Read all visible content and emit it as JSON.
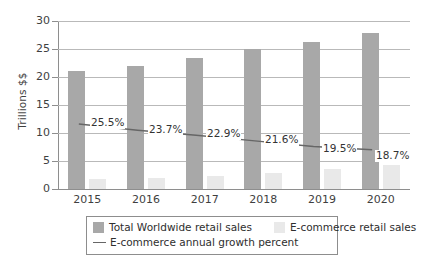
{
  "chart_data": {
    "type": "bar",
    "title": "",
    "subtitle": "",
    "xlabel": "",
    "ylabel": "Trillions $$",
    "categories": [
      "2015",
      "2016",
      "2017",
      "2018",
      "2019",
      "2020"
    ],
    "ylim": [
      0,
      30
    ],
    "y_ticks": [
      "0",
      "5",
      "10",
      "15",
      "20",
      "25",
      "30"
    ],
    "y_tick_values": [
      0,
      5,
      10,
      15,
      20,
      25,
      30
    ],
    "grid": true,
    "legend_position": "bottom",
    "series": [
      {
        "name": "Total Worldwide retail sales",
        "type": "bar",
        "color": "#a8a8a8",
        "values": [
          21.0,
          22.0,
          23.4,
          25.0,
          26.3,
          27.8
        ]
      },
      {
        "name": "E-commerce retail sales",
        "type": "bar",
        "color": "#e9e9e9",
        "values": [
          1.7,
          2.0,
          2.4,
          2.9,
          3.5,
          4.2
        ]
      },
      {
        "name": "E-commerce annual growth percent",
        "type": "line",
        "color": "#666666",
        "values": [
          25.5,
          23.7,
          22.9,
          21.6,
          19.5,
          18.7
        ],
        "plotted_y": [
          11.6,
          10.5,
          9.6,
          8.6,
          7.6,
          7.0
        ],
        "data_labels": [
          "25.5%",
          "23.7%",
          "22.9%",
          "21.6%",
          "19.5%",
          "18.7%"
        ]
      }
    ]
  },
  "axes": {
    "y_title": "Trillions $$",
    "y_labels": [
      "30",
      "25",
      "20",
      "15",
      "10",
      "5",
      "0"
    ],
    "x_labels": [
      "2015",
      "2016",
      "2017",
      "2018",
      "2019",
      "2020"
    ]
  },
  "growth_labels": [
    {
      "text": "25.5%",
      "x": 32,
      "y": 96
    },
    {
      "text": "23.7%",
      "x": 90,
      "y": 103
    },
    {
      "text": "22.9%",
      "x": 148,
      "y": 107
    },
    {
      "text": "21.6%",
      "x": 206,
      "y": 113
    },
    {
      "text": "19.5%",
      "x": 264,
      "y": 122
    },
    {
      "text": "18.7%",
      "x": 317,
      "y": 129
    }
  ],
  "legend": {
    "items": [
      {
        "label": "Total Worldwide retail sales",
        "marker": "swatch",
        "color": "#a8a8a8"
      },
      {
        "label": "E-commerce retail sales",
        "marker": "swatch",
        "color": "#e9e9e9"
      },
      {
        "label": "E-commerce annual growth percent",
        "marker": "line",
        "color": "#666666"
      }
    ]
  },
  "colors": {
    "total_bar": "#a8a8a8",
    "ecom_bar": "#e9e9e9",
    "growth_line": "#666666",
    "gridline": "#b9b9b9",
    "axis": "#8e8e8e",
    "text": "#3a3a3a",
    "background": "#ffffff"
  }
}
